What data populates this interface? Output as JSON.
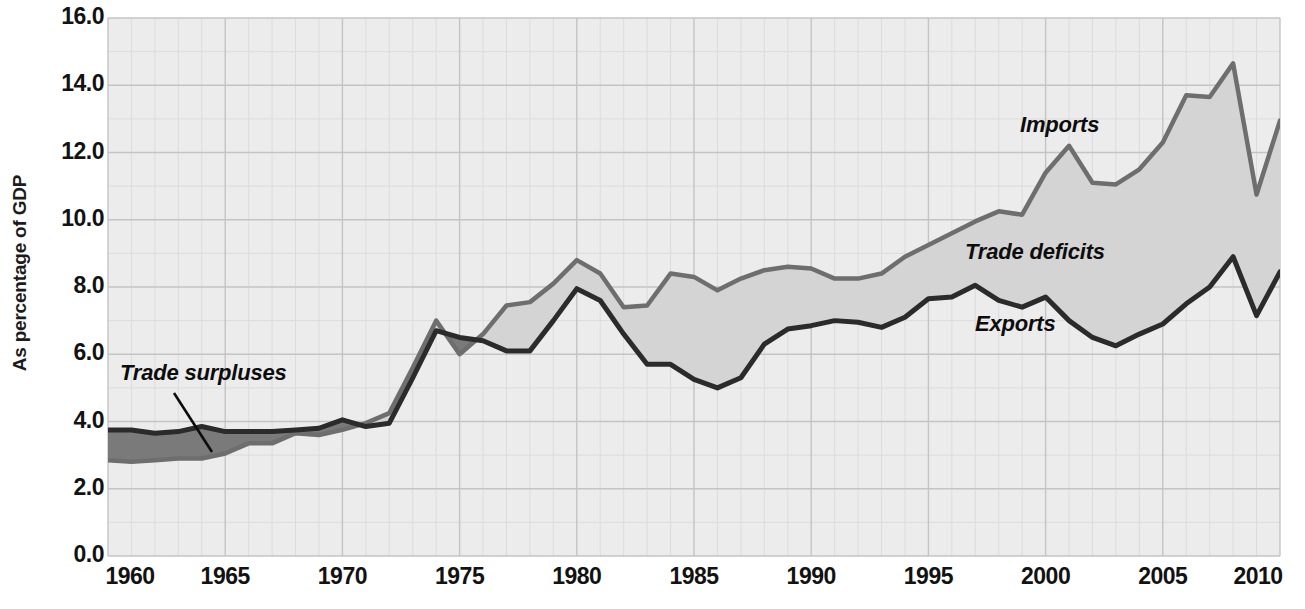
{
  "chart_data": {
    "type": "area",
    "title": "",
    "subtitle": "",
    "xlabel": "",
    "ylabel": "As percentage of GDP",
    "xlim": [
      1960,
      2010
    ],
    "ylim": [
      0.0,
      16.0
    ],
    "grid": true,
    "minor_grid_x": "every 1 year",
    "major_grid_x": "every 5 years",
    "legend_position": "inline annotations",
    "y_ticks": [
      "0.0",
      "2.0",
      "4.0",
      "6.0",
      "8.0",
      "10.0",
      "12.0",
      "14.0",
      "16.0"
    ],
    "y_tick_values": [
      0.0,
      2.0,
      4.0,
      6.0,
      8.0,
      10.0,
      12.0,
      14.0,
      16.0
    ],
    "x_ticks": [
      "1960",
      "1965",
      "1970",
      "1975",
      "1980",
      "1985",
      "1990",
      "1995",
      "2000",
      "2005",
      "2010"
    ],
    "x_tick_values": [
      1960,
      1965,
      1970,
      1975,
      1980,
      1985,
      1990,
      1995,
      2000,
      2005,
      2010
    ],
    "x": [
      1960,
      1961,
      1962,
      1963,
      1964,
      1965,
      1966,
      1967,
      1968,
      1969,
      1970,
      1971,
      1972,
      1973,
      1974,
      1975,
      1976,
      1977,
      1978,
      1979,
      1980,
      1981,
      1982,
      1983,
      1984,
      1985,
      1986,
      1987,
      1988,
      1989,
      1990,
      1991,
      1992,
      1993,
      1994,
      1995,
      1996,
      1997,
      1998,
      1999,
      2000,
      2001,
      2002,
      2003,
      2004,
      2005,
      2006,
      2007,
      2008,
      2009,
      2010
    ],
    "series": [
      {
        "name": "Exports",
        "color": "#2b2b2b",
        "values": [
          3.75,
          3.75,
          3.65,
          3.7,
          3.85,
          3.7,
          3.7,
          3.7,
          3.75,
          3.8,
          4.05,
          3.85,
          3.95,
          5.3,
          6.7,
          6.5,
          6.4,
          6.1,
          6.1,
          7.0,
          7.95,
          7.6,
          6.6,
          5.7,
          5.7,
          5.25,
          5.0,
          5.3,
          6.3,
          6.75,
          6.85,
          7.0,
          6.95,
          6.8,
          7.1,
          7.65,
          7.7,
          8.05,
          7.6,
          7.4,
          7.7,
          7.0,
          6.5,
          6.25,
          6.6,
          6.9,
          7.5,
          8.0,
          8.9,
          7.15,
          8.45
        ]
      },
      {
        "name": "Imports",
        "color": "#6e6e6e",
        "values": [
          2.85,
          2.8,
          2.85,
          2.9,
          2.9,
          3.05,
          3.35,
          3.35,
          3.65,
          3.6,
          3.75,
          3.95,
          4.25,
          5.6,
          7.0,
          6.0,
          6.6,
          7.45,
          7.55,
          8.1,
          8.8,
          8.4,
          7.4,
          7.45,
          8.4,
          8.3,
          7.9,
          8.25,
          8.5,
          8.6,
          8.55,
          8.25,
          8.25,
          8.4,
          8.9,
          9.25,
          9.6,
          9.95,
          10.25,
          10.15,
          11.4,
          12.2,
          11.1,
          11.05,
          11.5,
          12.3,
          13.7,
          13.65,
          14.65,
          10.75,
          12.95
        ]
      }
    ],
    "fills": [
      {
        "name": "Trade surpluses",
        "color": "#7a7a7a",
        "description": "Region where exports exceed imports (1960-1973)"
      },
      {
        "name": "Trade deficits",
        "color": "#d4d4d4",
        "description": "Region where imports exceed exports (1974-2010)"
      }
    ],
    "annotations": [
      {
        "name": "trade-surpluses-label",
        "text": "Trade surpluses",
        "x_px": 120,
        "y_px": 360,
        "leader_line": true
      },
      {
        "name": "imports-label",
        "text": "Imports",
        "x_px": 1020,
        "y_px": 112,
        "leader_line": false
      },
      {
        "name": "trade-deficits-label",
        "text": "Trade deficits",
        "x_px": 965,
        "y_px": 239,
        "leader_line": false
      },
      {
        "name": "exports-label",
        "text": "Exports",
        "x_px": 975,
        "y_px": 311,
        "leader_line": false
      }
    ]
  },
  "colors": {
    "plot_background": "#ececec",
    "minor_gridline": "#dcdcdc",
    "major_gridline": "#c4c4c4",
    "exports_line": "#2b2b2b",
    "imports_line": "#6e6e6e",
    "surplus_fill": "#7a7a7a",
    "deficit_fill": "#d4d4d4",
    "text": "#121212"
  },
  "axis": {
    "y_title": "As percentage of GDP"
  }
}
